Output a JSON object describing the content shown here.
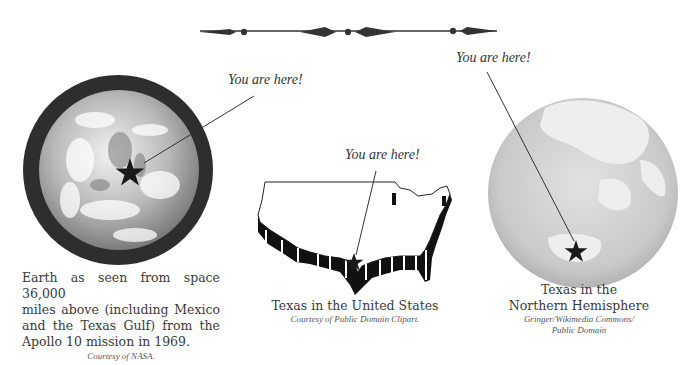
{
  "ornament": {
    "name": "decorative-divider"
  },
  "panels": [
    {
      "id": "earth-from-space",
      "pointer_label": "You are here!",
      "caption_lines": [
        "Earth as seen from space 36,000",
        "miles above (including Mexico",
        "and the Texas Gulf) from the",
        "Apollo 10 mission in 1969."
      ],
      "credit": "Courtesy of NASA."
    },
    {
      "id": "texas-in-us",
      "pointer_label": "You are here!",
      "caption": "Texas in the United States",
      "credit": "Courtesy of Public Domain Clipart."
    },
    {
      "id": "texas-in-hemisphere",
      "pointer_label": "You are here!",
      "caption_lines": [
        "Texas in the",
        "Northern Hemisphere"
      ],
      "credit_lines": [
        "Gringer/Wikimedia Commons/",
        "Public Domain"
      ]
    }
  ],
  "colors": {
    "ink": "#333333",
    "ring": "#2e2e2e",
    "globe_light": "#e6e6e6",
    "globe_mid": "#bdbdbd"
  }
}
